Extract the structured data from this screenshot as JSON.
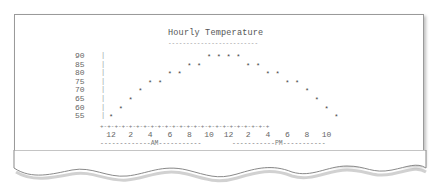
{
  "chart_data": {
    "type": "scatter",
    "title": "Hourly Temperature",
    "xlabel": "",
    "ylabel": "",
    "x": [
      "12 AM",
      "1 AM",
      "2 AM",
      "3 AM",
      "4 AM",
      "5 AM",
      "6 AM",
      "7 AM",
      "8 AM",
      "9 AM",
      "10 AM",
      "11 AM",
      "12 PM",
      "1 PM",
      "2 PM",
      "3 PM",
      "4 PM",
      "5 PM",
      "6 PM",
      "7 PM",
      "8 PM",
      "9 PM",
      "10 PM",
      "11 PM"
    ],
    "values": [
      55,
      60,
      65,
      70,
      75,
      75,
      80,
      80,
      85,
      85,
      90,
      90,
      90,
      90,
      85,
      85,
      80,
      80,
      75,
      75,
      70,
      65,
      60,
      55
    ],
    "y_ticks": [
      90,
      85,
      80,
      75,
      70,
      65,
      60,
      55
    ],
    "ylim": [
      55,
      90
    ],
    "x_tick_labels": [
      "12",
      "2",
      "4",
      "6",
      "8",
      "10",
      "12",
      "2",
      "4",
      "6",
      "8",
      "10"
    ],
    "period_labels": [
      "AM",
      "PM"
    ],
    "grid": false,
    "marker": "*"
  },
  "labels": {
    "title": "Hourly Temperature",
    "title_rule": "-------------------------",
    "am": "-------------AM-----------",
    "pm": "-----------PM-----------",
    "axis": "+-+-+-+-+-+-+-+-+-+-+-+-+-+-+-+-+-+-+-+-+-+-+-+"
  }
}
